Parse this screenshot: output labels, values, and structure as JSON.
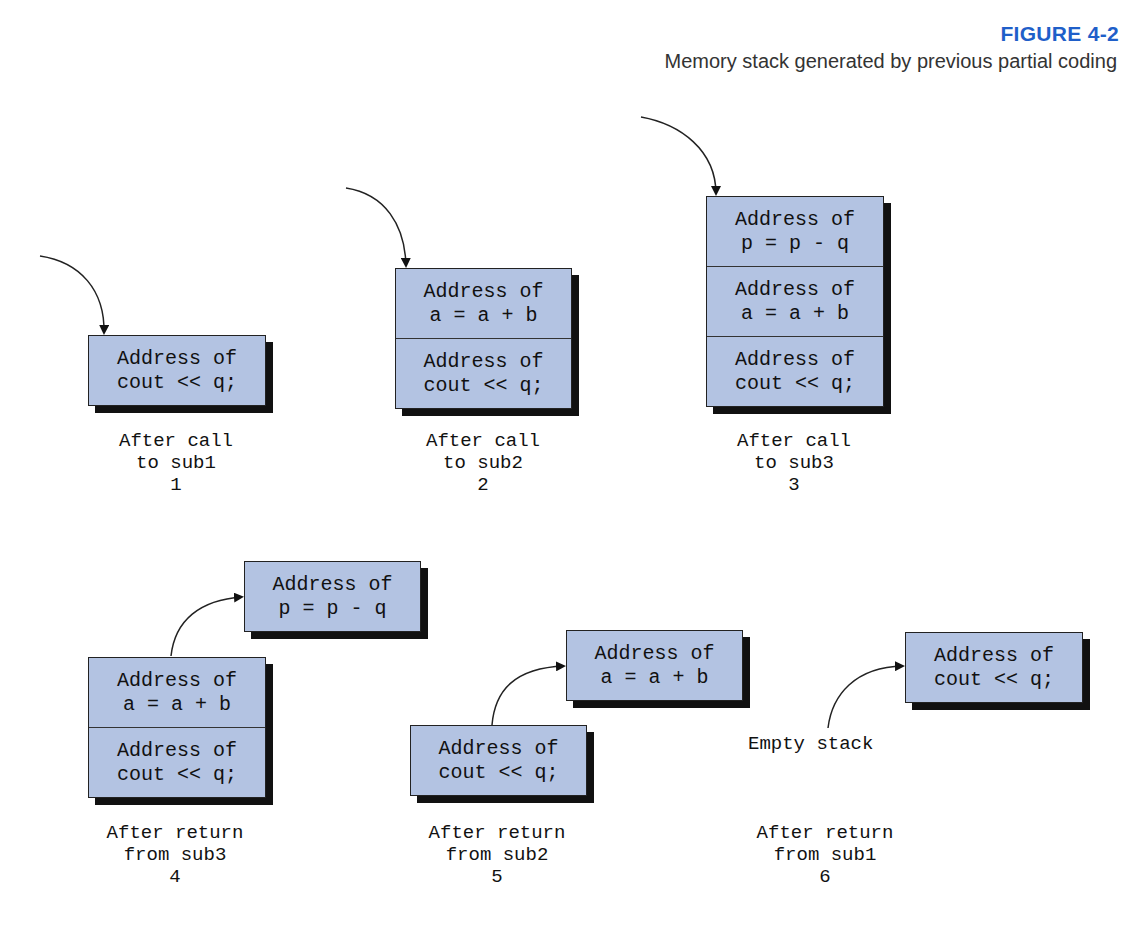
{
  "figure": {
    "number": "FIGURE 4-2",
    "caption": "Memory stack generated by previous partial coding",
    "accent_color": "#1f5fc9",
    "box_color": "#b3c3e2"
  },
  "panels": [
    {
      "id": 1,
      "stack": [
        {
          "line1": "Address of",
          "line2": "cout << q;"
        }
      ],
      "label": {
        "line1": "After call",
        "line2": "to sub1",
        "number": "1"
      }
    },
    {
      "id": 2,
      "stack": [
        {
          "line1": "Address of",
          "line2": "a = a + b"
        },
        {
          "line1": "Address of",
          "line2": "cout << q;"
        }
      ],
      "label": {
        "line1": "After call",
        "line2": "to sub2",
        "number": "2"
      }
    },
    {
      "id": 3,
      "stack": [
        {
          "line1": "Address of",
          "line2": "p = p - q"
        },
        {
          "line1": "Address of",
          "line2": "a = a + b"
        },
        {
          "line1": "Address of",
          "line2": "cout << q;"
        }
      ],
      "label": {
        "line1": "After call",
        "line2": "to sub3",
        "number": "3"
      }
    },
    {
      "id": 4,
      "popped": {
        "line1": "Address of",
        "line2": "p = p - q"
      },
      "stack": [
        {
          "line1": "Address of",
          "line2": "a = a + b"
        },
        {
          "line1": "Address of",
          "line2": "cout << q;"
        }
      ],
      "label": {
        "line1": "After return",
        "line2": "from sub3",
        "number": "4"
      }
    },
    {
      "id": 5,
      "popped": {
        "line1": "Address of",
        "line2": "a = a + b"
      },
      "stack": [
        {
          "line1": "Address of",
          "line2": "cout << q;"
        }
      ],
      "label": {
        "line1": "After return",
        "line2": "from sub2",
        "number": "5"
      }
    },
    {
      "id": 6,
      "popped": {
        "line1": "Address of",
        "line2": "cout << q;"
      },
      "empty_text": "Empty stack",
      "label": {
        "line1": "After return",
        "line2": "from sub1",
        "number": "6"
      }
    }
  ]
}
